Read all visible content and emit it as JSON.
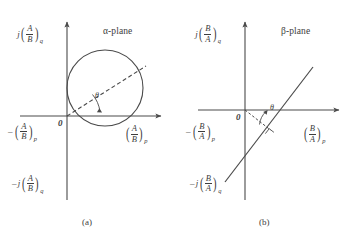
{
  "figure": {
    "background_color": "#ffffff",
    "ink_color": "#4a4a4a",
    "panels": [
      {
        "id": "panel-a",
        "caption": "(a)",
        "plane_title": "α-plane",
        "origin_label": "0",
        "angle_label": "θ",
        "axes": {
          "vertical_positive_label": {
            "prefix": "j",
            "minus": "",
            "numerator": "A",
            "denominator": "B",
            "subscript": "q"
          },
          "vertical_negative_label": {
            "prefix": "j",
            "minus": "–",
            "numerator": "A",
            "denominator": "B",
            "subscript": "q"
          },
          "horizontal_positive_label": {
            "prefix": "",
            "minus": "",
            "numerator": "A",
            "denominator": "B",
            "subscript": "p"
          },
          "horizontal_negative_label": {
            "prefix": "",
            "minus": "–",
            "numerator": "A",
            "denominator": "B",
            "subscript": "p"
          }
        },
        "locus": {
          "type": "circle",
          "description": "circle through the origin, tangent to the imaginary axis",
          "center_px": [
            105,
            88
          ],
          "radius_px": 38
        },
        "ray": {
          "type": "dashed-chord",
          "from_px": [
            67,
            116
          ],
          "to_px": [
            146,
            66
          ],
          "angle_deg": 32
        }
      },
      {
        "id": "panel-b",
        "caption": "(b)",
        "plane_title": "β-plane",
        "origin_label": "0",
        "angle_label": "θ",
        "axes": {
          "vertical_positive_label": {
            "prefix": "j",
            "minus": "",
            "numerator": "B",
            "denominator": "A",
            "subscript": "q"
          },
          "vertical_negative_label": {
            "prefix": "j",
            "minus": "–",
            "numerator": "B",
            "denominator": "A",
            "subscript": "q"
          },
          "horizontal_positive_label": {
            "prefix": "",
            "minus": "",
            "numerator": "B",
            "denominator": "A",
            "subscript": "p"
          },
          "horizontal_negative_label": {
            "prefix": "",
            "minus": "–",
            "numerator": "B",
            "denominator": "A",
            "subscript": "p"
          }
        },
        "locus": {
          "type": "straight-line",
          "description": "inclined straight line crossing the real axis",
          "from_px": [
            226,
            180
          ],
          "to_px": [
            312,
            68
          ],
          "angle_deg": 52
        },
        "ray": {
          "type": "dashed-perpendicular",
          "from_px": [
            245,
            110
          ],
          "to_px": [
            268,
            134
          ],
          "right_angle_marker": true
        }
      }
    ]
  }
}
